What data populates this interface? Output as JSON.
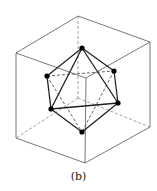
{
  "figure": {
    "caption": "(b)",
    "stroke_color": "#555555",
    "edge_color": "#222222",
    "vertex_color": "#000000",
    "cube": {
      "vertices": {
        "back_top": [
          78,
          16
        ],
        "left_top": [
          16,
          53
        ],
        "right_top": [
          150,
          42
        ],
        "front_top": [
          86,
          78
        ],
        "back_bottom": [
          78,
          98
        ],
        "left_bottom": [
          16,
          138
        ],
        "right_bottom": [
          150,
          127
        ],
        "front_bottom": [
          85,
          163
        ]
      },
      "solid_edges": [
        [
          "back_top",
          "left_top"
        ],
        [
          "back_top",
          "right_top"
        ],
        [
          "left_top",
          "front_top"
        ],
        [
          "right_top",
          "front_top"
        ],
        [
          "left_top",
          "left_bottom"
        ],
        [
          "right_top",
          "right_bottom"
        ],
        [
          "front_top",
          "front_bottom"
        ],
        [
          "left_bottom",
          "front_bottom"
        ],
        [
          "right_bottom",
          "front_bottom"
        ]
      ],
      "dashed_edges": [
        [
          "back_top",
          "back_bottom"
        ],
        [
          "back_bottom",
          "left_bottom"
        ],
        [
          "back_bottom",
          "right_bottom"
        ]
      ]
    },
    "octahedron": {
      "vertices": {
        "top": [
          82,
          48
        ],
        "left": [
          47,
          76
        ],
        "right": [
          114,
          71
        ],
        "lower_left": [
          51,
          109
        ],
        "lower_right": [
          118,
          103
        ],
        "bottom": [
          82,
          132
        ]
      },
      "solid_edges": [
        [
          "top",
          "left"
        ],
        [
          "top",
          "right"
        ],
        [
          "top",
          "lower_left"
        ],
        [
          "top",
          "lower_right"
        ],
        [
          "left",
          "lower_left"
        ],
        [
          "right",
          "lower_right"
        ],
        [
          "lower_left",
          "lower_right"
        ],
        [
          "lower_left",
          "bottom"
        ],
        [
          "lower_right",
          "bottom"
        ]
      ],
      "dashed_edges": [
        [
          "left",
          "right"
        ],
        [
          "left",
          "bottom"
        ],
        [
          "right",
          "bottom"
        ]
      ]
    }
  }
}
